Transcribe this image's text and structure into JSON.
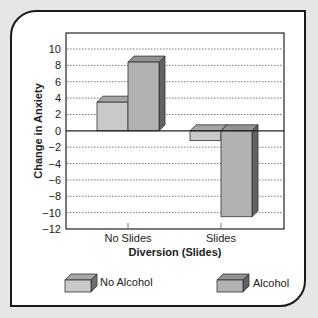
{
  "chart_data": {
    "type": "bar",
    "title": "",
    "xlabel": "Diversion (Slides)",
    "ylabel": "Change in Anxiety",
    "categories": [
      "No Slides",
      "Slides"
    ],
    "series": [
      {
        "name": "No Alcohol",
        "values": [
          3.5,
          -1.2
        ],
        "color": "#c9c9c9"
      },
      {
        "name": "Alcohol",
        "values": [
          8.4,
          -10.5
        ],
        "color": "#b2b2b2"
      }
    ],
    "ylim": [
      -12,
      12
    ],
    "yticks": [
      10,
      8,
      6,
      4,
      2,
      0,
      -2,
      -4,
      -6,
      -8,
      -10,
      -12
    ],
    "ytick_labels": [
      "10",
      "8",
      "6",
      "4",
      "2",
      "0",
      "−2",
      "−4",
      "−6",
      "−8",
      "−10",
      "−12"
    ],
    "grid": true,
    "legend_position": "bottom",
    "style": "3d-bar"
  },
  "legend": {
    "items": [
      {
        "label": "No Alcohol"
      },
      {
        "label": "Alcohol"
      }
    ]
  }
}
